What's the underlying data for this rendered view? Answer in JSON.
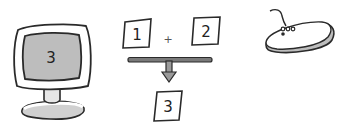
{
  "diagram": {
    "monitor": {
      "screen_value": "3",
      "screen_color": "#bdbdbd",
      "frame_color": "#ffffff",
      "stroke_color": "#2a2a2a"
    },
    "addition": {
      "operand_a": "1",
      "operator": "+",
      "operand_b": "2",
      "result": "3"
    },
    "mouse": {
      "body_color": "#ffffff",
      "shade_color": "#bdbdbd"
    }
  }
}
